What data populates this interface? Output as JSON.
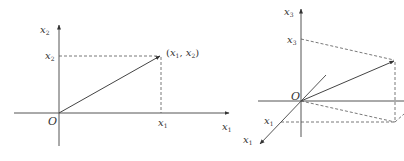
{
  "colors": {
    "axis": "#555555",
    "vector": "#444444",
    "dashed": "#555555",
    "text": "#333333",
    "background": "#ffffff"
  },
  "left_diagram": {
    "title": "2D vector in plane",
    "origin_label": "O",
    "axis_x": {
      "var": "x",
      "sub": "1"
    },
    "axis_y": {
      "var": "x",
      "sub": "2"
    },
    "tick_x": {
      "var": "x",
      "sub": "1"
    },
    "tick_y": {
      "var": "x",
      "sub": "2"
    },
    "point_label": {
      "open": "(",
      "v1": "x",
      "s1": "1",
      "sep": ", ",
      "v2": "x",
      "s2": "2",
      "close": ")"
    }
  },
  "right_diagram": {
    "title": "3D vector in space",
    "origin_label": "O",
    "axis_vertical": {
      "var": "x",
      "sub": "3"
    },
    "axis_diagonal": {
      "var": "x",
      "sub": "1"
    },
    "tick_vertical": {
      "var": "x",
      "sub": "3"
    },
    "tick_diagonal": {
      "var": "x",
      "sub": "1"
    }
  }
}
